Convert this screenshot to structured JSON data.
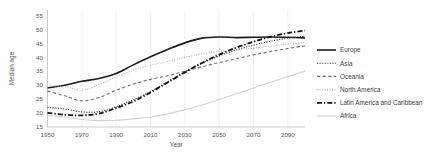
{
  "chart_data": {
    "type": "line",
    "title": "",
    "xlabel": "Year",
    "ylabel": "Median age",
    "xlim": [
      1950,
      2100
    ],
    "ylim": [
      15,
      57
    ],
    "xticks": [
      1950,
      1970,
      1990,
      2010,
      2030,
      2050,
      2070,
      2090
    ],
    "yticks": [
      15,
      20,
      25,
      30,
      35,
      40,
      45,
      50,
      55
    ],
    "grid": "vertical-only",
    "legend_position": "right",
    "x": [
      1950,
      1960,
      1970,
      1980,
      1990,
      2000,
      2010,
      2020,
      2030,
      2040,
      2050,
      2060,
      2070,
      2080,
      2090,
      2100
    ],
    "series": [
      {
        "name": "Europe",
        "style": "solid",
        "color": "#1a1a1a",
        "width": 1.6,
        "values": [
          29.0,
          30.0,
          31.4,
          32.4,
          34.2,
          37.3,
          40.2,
          42.8,
          45.2,
          46.9,
          47.3,
          47.1,
          47.2,
          47.3,
          47.2,
          47.0
        ]
      },
      {
        "name": "Asia",
        "style": "dotted",
        "color": "#2b2b2b",
        "width": 1.1,
        "values": [
          22.0,
          21.5,
          20.4,
          20.5,
          22.2,
          24.8,
          27.7,
          31.3,
          34.8,
          37.9,
          40.5,
          42.7,
          44.4,
          45.8,
          46.9,
          47.6
        ]
      },
      {
        "name": "Oceania",
        "style": "dashed",
        "color": "#6e6e6e",
        "width": 1.1,
        "values": [
          27.9,
          26.2,
          24.4,
          25.6,
          28.2,
          30.4,
          32.1,
          33.4,
          35.0,
          36.6,
          38.1,
          39.5,
          40.9,
          42.1,
          43.2,
          44.1
        ]
      },
      {
        "name": "North America",
        "style": "fine-dotted",
        "color": "#b0b0b0",
        "width": 1.1,
        "values": [
          29.8,
          29.5,
          28.2,
          30.2,
          32.9,
          35.4,
          37.2,
          38.5,
          40.0,
          41.3,
          42.1,
          42.7,
          43.3,
          44.0,
          44.8,
          45.4
        ]
      },
      {
        "name": "Latin America and Caribbean",
        "style": "dash-dot",
        "color": "#111111",
        "width": 1.8,
        "values": [
          20.1,
          19.4,
          19.2,
          19.8,
          21.8,
          24.2,
          27.4,
          31.0,
          34.6,
          38.0,
          41.0,
          43.5,
          45.6,
          47.4,
          48.7,
          49.6
        ]
      },
      {
        "name": "Africa",
        "style": "solid",
        "color": "#d2d2d2",
        "width": 1.1,
        "values": [
          19.1,
          18.6,
          17.7,
          17.3,
          17.4,
          17.9,
          18.6,
          19.7,
          21.2,
          22.9,
          24.9,
          26.9,
          29.0,
          31.1,
          33.1,
          35.0
        ]
      }
    ]
  },
  "legend": {
    "items": [
      {
        "label": "Europe"
      },
      {
        "label": "Asia"
      },
      {
        "label": "Oceania"
      },
      {
        "label": "North America"
      },
      {
        "label": "Latin America and Caribbean"
      },
      {
        "label": "Africa"
      }
    ]
  }
}
